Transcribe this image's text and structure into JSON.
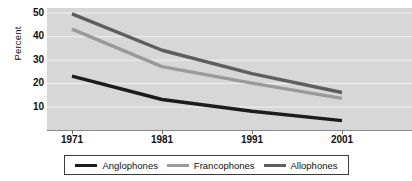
{
  "chart_data": {
    "type": "line",
    "title": "",
    "xlabel": "",
    "ylabel": "Percent",
    "x": [
      1971,
      1981,
      1991,
      2001
    ],
    "xtick_labels": [
      "1971",
      "1981",
      "1991",
      "2001"
    ],
    "ytick_labels": [
      "10",
      "20",
      "30",
      "40",
      "50"
    ],
    "yticks": [
      10,
      20,
      30,
      40,
      50
    ],
    "ylim": [
      0,
      52
    ],
    "grid": true,
    "legend_position": "bottom",
    "series": [
      {
        "name": "Anglophones",
        "color": "#1c1c1c",
        "values": [
          23,
          13,
          8,
          4
        ]
      },
      {
        "name": "Francophones",
        "color": "#9a9a9a",
        "values": [
          43,
          27,
          20,
          13.5
        ]
      },
      {
        "name": "Allophones",
        "color": "#5e5e5e",
        "values": [
          49.5,
          34,
          24,
          16
        ]
      }
    ]
  },
  "legend": {
    "items": [
      {
        "label": "Anglophones",
        "color": "#1c1c1c"
      },
      {
        "label": "Francophones",
        "color": "#9a9a9a"
      },
      {
        "label": "Allophones",
        "color": "#5e5e5e"
      }
    ]
  },
  "colors": {
    "plot_background": "#d7d7d7",
    "gridline": "#f0f0f0",
    "axis": "#8a8a8a",
    "text": "#111111",
    "page_background": "#ffffff"
  }
}
